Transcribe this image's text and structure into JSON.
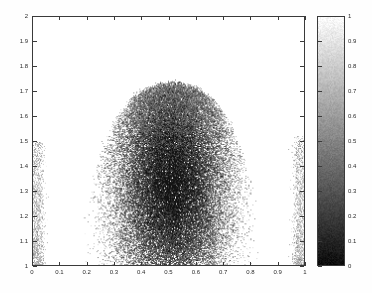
{
  "figure": {
    "background_color": "#ffffff",
    "frame_color": "#3a3a3a",
    "text_color": "#2a2a2a"
  },
  "chart_data": {
    "type": "scatter",
    "title": "",
    "subtitle": "",
    "xlabel": "",
    "ylabel": "",
    "xlim": [
      0,
      1
    ],
    "ylim": [
      1,
      2
    ],
    "grid": false,
    "legend": null,
    "colormap": "gray",
    "colorbar": {
      "position": "right",
      "orientation": "vertical",
      "vmin": 0,
      "vmax": 1,
      "low_color": "#0d0d0d",
      "high_color": "#fbfbfb",
      "ticks": [
        1,
        0.9,
        0.8,
        0.7,
        0.6,
        0.5,
        0.4,
        0.3,
        0.2,
        0.1,
        0
      ],
      "tick_labels": [
        "1",
        "0.9",
        "0.8",
        "0.7",
        "0.6",
        "0.5",
        "0.4",
        "0.3",
        "0.2",
        "0.1",
        "0"
      ]
    },
    "xticks": [
      0,
      0.1,
      0.2,
      0.3,
      0.4,
      0.5,
      0.6,
      0.7,
      0.8,
      0.9,
      1
    ],
    "xtick_labels": [
      "0",
      "0.1",
      "0.2",
      "0.3",
      "0.4",
      "0.5",
      "0.6",
      "0.7",
      "0.8",
      "0.9",
      "1"
    ],
    "yticks": [
      1,
      1.1,
      1.2,
      1.3,
      1.4,
      1.5,
      1.6,
      1.7,
      1.8,
      1.9,
      2
    ],
    "ytick_labels": [
      "1",
      "1.1",
      "1.2",
      "1.3",
      "1.4",
      "1.5",
      "1.6",
      "1.7",
      "1.8",
      "1.9",
      "2"
    ],
    "clusters": [
      {
        "name": "main-dome",
        "shape": "dome",
        "x_center": 0.51,
        "y_base": 1.0,
        "x_half_width": 0.34,
        "y_peak": 1.73,
        "n_points": 52000,
        "point_size_px": 1,
        "value_range": [
          0.05,
          0.95
        ],
        "mean_value": 0.42
      },
      {
        "name": "left-edge-streak",
        "shape": "vertical-band",
        "x_center": 0.015,
        "x_half_width": 0.022,
        "y_min": 1.0,
        "y_max": 1.5,
        "n_points": 1400,
        "point_size_px": 1,
        "value_range": [
          0.55,
          0.95
        ],
        "mean_value": 0.8
      },
      {
        "name": "right-edge-streak",
        "shape": "vertical-band",
        "x_center": 0.982,
        "x_half_width": 0.022,
        "y_min": 1.0,
        "y_max": 1.52,
        "n_points": 1400,
        "point_size_px": 1,
        "value_range": [
          0.55,
          0.95
        ],
        "mean_value": 0.8
      }
    ]
  }
}
